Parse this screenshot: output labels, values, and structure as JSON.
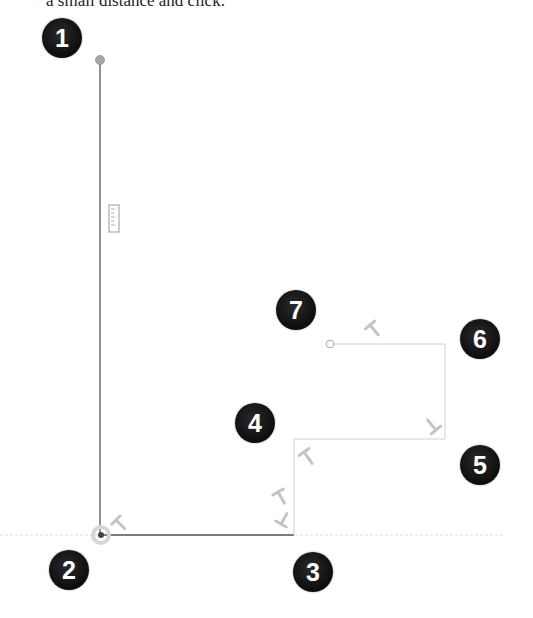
{
  "caption": "a small distance and click.",
  "markers": [
    {
      "label": "1",
      "x": 62,
      "y": 38
    },
    {
      "label": "2",
      "x": 69,
      "y": 570
    },
    {
      "label": "3",
      "x": 313,
      "y": 572
    },
    {
      "label": "4",
      "x": 255,
      "y": 423
    },
    {
      "label": "5",
      "x": 480,
      "y": 465
    },
    {
      "label": "6",
      "x": 480,
      "y": 339
    },
    {
      "label": "7",
      "x": 296,
      "y": 310
    }
  ],
  "colors": {
    "drawn_line": "#555555",
    "preview_line": "#cfcfcf",
    "inference_line": "#d8d8d8",
    "endpoint_fill": "#a8a8a8",
    "constraint_glyph": "#c4c4c4",
    "marker_bg": "#111111",
    "marker_text": "#ffffff"
  },
  "icons": {
    "ruler": "ruler-icon",
    "perpendicular": "perpendicular-constraint-icon",
    "start_point": "start-point-icon",
    "open_point": "open-endpoint-icon"
  }
}
